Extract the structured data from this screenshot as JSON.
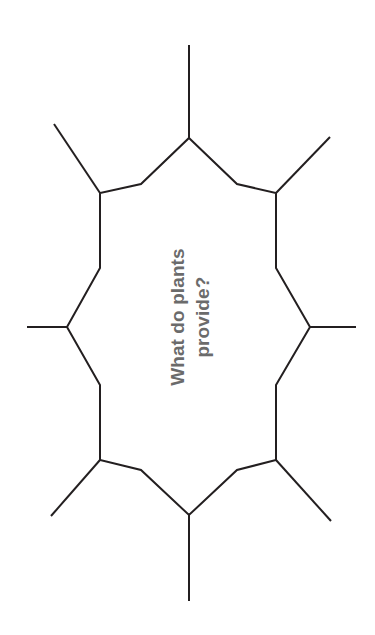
{
  "page": {
    "background_color": "#ffffff",
    "width": 375,
    "height": 635
  },
  "worksheet": {
    "name": "concept-web-worksheet",
    "orientation": "rotated-90-counterclockwise",
    "center_prompt": {
      "full_text": "What do plants provide?",
      "lines": [
        "What do plants",
        "provide?"
      ],
      "text_color": "#6b6b6b",
      "rotation_degrees": -90
    },
    "shape": {
      "type": "notched-octagon-spider-web",
      "stroke_color": "#231f20",
      "stroke_width": 2,
      "fill_color": "#ffffff",
      "spoke_count": 8,
      "spoke_labels": [
        "spoke-top",
        "spoke-top-right",
        "spoke-right",
        "spoke-bottom-right",
        "spoke-bottom",
        "spoke-bottom-left",
        "spoke-left",
        "spoke-top-left"
      ],
      "outline_points": "189,138 237,184 276,193 276,268 310,327 276,385 276,460 237,470 189,515 141,470 100,460 100,385 67,327 100,268 100,193 141,184",
      "spokes": [
        {
          "name": "spoke-top",
          "x1": 189,
          "y1": 138,
          "x2": 189,
          "y2": 45
        },
        {
          "name": "spoke-top-left",
          "x1": 100,
          "y1": 193,
          "x2": 54,
          "y2": 124
        },
        {
          "name": "spoke-top-right",
          "x1": 276,
          "y1": 193,
          "x2": 330,
          "y2": 137
        },
        {
          "name": "spoke-left",
          "x1": 67,
          "y1": 327,
          "x2": 27,
          "y2": 327
        },
        {
          "name": "spoke-right",
          "x1": 310,
          "y1": 327,
          "x2": 356,
          "y2": 327
        },
        {
          "name": "spoke-bottom-left",
          "x1": 100,
          "y1": 460,
          "x2": 51,
          "y2": 516
        },
        {
          "name": "spoke-bottom-right",
          "x1": 276,
          "y1": 460,
          "x2": 331,
          "y2": 521
        },
        {
          "name": "spoke-bottom",
          "x1": 189,
          "y1": 515,
          "x2": 189,
          "y2": 601
        }
      ]
    }
  },
  "chart_data": {
    "type": "diagram",
    "title": "What do plants provide?",
    "diagram_kind": "concept-web",
    "center_node_text": "What do plants provide?",
    "branch_count": 8,
    "branch_values": [
      "",
      "",
      "",
      "",
      "",
      "",
      "",
      ""
    ]
  }
}
